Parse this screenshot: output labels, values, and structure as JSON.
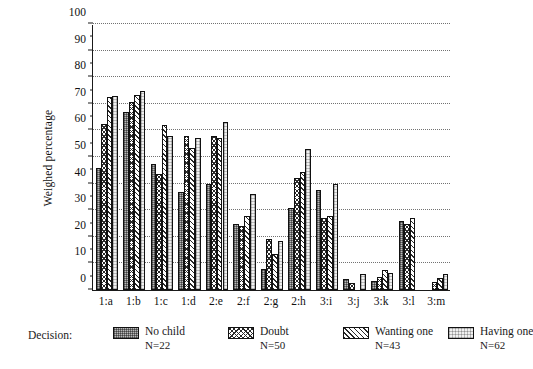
{
  "chart_data": {
    "type": "bar",
    "title": "",
    "xlabel": "",
    "ylabel": "Weighed percentage",
    "ylim": [
      0,
      100
    ],
    "ytick_step": 10,
    "yticks": [
      0,
      10,
      20,
      30,
      40,
      50,
      60,
      70,
      80,
      90,
      100
    ],
    "grid": true,
    "grid_axis": "y",
    "grid_style": "dotted",
    "legend_position": "below-axes",
    "legend_title": "Decision:",
    "categories": [
      "1:a",
      "1:b",
      "1:c",
      "1:d",
      "2:e",
      "2:f",
      "2:g",
      "2:h",
      "3:i",
      "3:j",
      "3:k",
      "3:l",
      "3:m"
    ],
    "series": [
      {
        "name": "No child",
        "n_label": "N=22",
        "n": 22,
        "pattern": "dense-stipple-gray",
        "values": [
          46,
          67,
          47.5,
          37,
          40,
          25,
          8,
          31,
          37.5,
          4,
          3.5,
          26,
          0
        ]
      },
      {
        "name": "Doubt",
        "n_label": "N=50",
        "n": 50,
        "pattern": "cross-hatch",
        "values": [
          62.5,
          70.5,
          43.5,
          58,
          58,
          24,
          19,
          42,
          27,
          2.5,
          5,
          25,
          3
        ]
      },
      {
        "name": "Wanting one",
        "n_label": "N=43",
        "n": 43,
        "pattern": "diagonal-hatch",
        "values": [
          72.5,
          73.5,
          62,
          53.5,
          57,
          28,
          13.5,
          44.5,
          28,
          0,
          7.5,
          27,
          4.5
        ]
      },
      {
        "name": "Having one",
        "n_label": "N=62",
        "n": 62,
        "pattern": "light-stipple",
        "values": [
          73,
          75,
          58,
          57,
          63,
          36,
          18.5,
          53,
          40,
          6,
          6.5,
          0,
          6
        ]
      }
    ]
  },
  "colors": {
    "axis": "#1a1a1a",
    "grid": "#6b6b6b",
    "background": "#ffffff",
    "series_no_child": "#b9b9b9",
    "series_doubt": "#ffffff",
    "series_wanting_one": "#ffffff",
    "series_having_one": "#f0f0f0"
  }
}
